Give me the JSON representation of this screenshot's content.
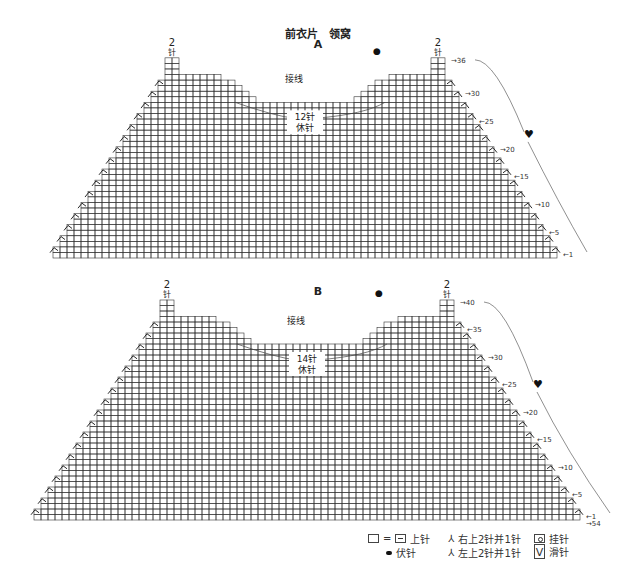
{
  "header": {
    "title": "前衣片　领窝",
    "chart_a_label": "A",
    "chart_b_label": "B"
  },
  "chart_data": [
    {
      "type": "diagram",
      "name": "A",
      "grid": {
        "left": 53,
        "right": 557,
        "bottom": 258,
        "cols": 72,
        "rows": 36,
        "cell_w": 7,
        "cell_h": 5.56
      },
      "shoulder_label_top": "2",
      "shoulder_label_bottom": "针",
      "join_label": "接线",
      "center_count_label": "12针",
      "center_hold_label": "休针",
      "row_markers": [
        {
          "row": 36,
          "label": "→36"
        },
        {
          "row": 30,
          "label": "→30"
        },
        {
          "row": 25,
          "label": "←25"
        },
        {
          "row": 20,
          "label": "→20"
        },
        {
          "row": 15,
          "label": "←15"
        },
        {
          "row": 10,
          "label": "→10"
        },
        {
          "row": 5,
          "label": "←5"
        },
        {
          "row": 1,
          "label": "←1"
        }
      ],
      "dot_symbol": "●",
      "heart_symbol": "♥"
    },
    {
      "type": "diagram",
      "name": "B",
      "grid": {
        "left": 34,
        "right": 580,
        "bottom": 520,
        "cols": 78,
        "rows": 40,
        "cell_w": 7,
        "cell_h": 5.5
      },
      "shoulder_label_top": "2",
      "shoulder_label_bottom": "针",
      "join_label": "接线",
      "center_count_label": "14针",
      "center_hold_label": "休针",
      "row_markers": [
        {
          "row": 40,
          "label": "→40"
        },
        {
          "row": 35,
          "label": "←35"
        },
        {
          "row": 30,
          "label": "→30"
        },
        {
          "row": 25,
          "label": "←25"
        },
        {
          "row": 20,
          "label": "→20"
        },
        {
          "row": 15,
          "label": "←15"
        },
        {
          "row": 10,
          "label": "→10"
        },
        {
          "row": 5,
          "label": "←5"
        },
        {
          "row": 1,
          "label": "←1"
        },
        {
          "row": 0,
          "label": "→54"
        }
      ],
      "dot_symbol": "●",
      "heart_symbol": "♥"
    }
  ],
  "legend": {
    "knit_eq": "=",
    "knit_label": "上针",
    "bind_off_label": "伏针",
    "right_dec_label": "右上2针并1针",
    "left_dec_label": "左上2针并1针",
    "yarn_over_label": "挂针",
    "slip_label": "滑针"
  }
}
